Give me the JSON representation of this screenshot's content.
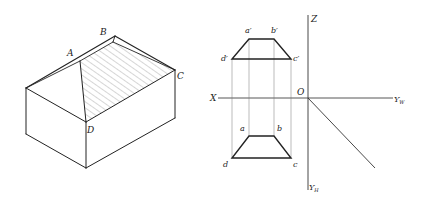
{
  "figure": {
    "left": {
      "title": "Isometric view of a hip-roof house",
      "labels": {
        "A": "A",
        "B": "B",
        "C": "C",
        "D": "D"
      },
      "hatched_face": "ABCD"
    },
    "right": {
      "title": "Orthographic projections of plane ABCD",
      "labels": {
        "a_prime": "a′",
        "b_prime": "b′",
        "c_prime": "c′",
        "d_prime": "d′",
        "a": "a",
        "b": "b",
        "c": "c",
        "d": "d",
        "X": "X",
        "Z": "Z",
        "O": "O",
        "Yw_main": "Y",
        "Yw_sub": "W",
        "Yh_main": "Y",
        "Yh_sub": "H"
      }
    },
    "colors": {
      "line": "#222222",
      "thin": "#555555",
      "hatch": "#888888"
    }
  }
}
